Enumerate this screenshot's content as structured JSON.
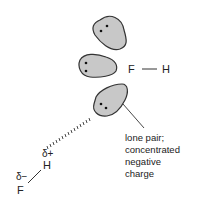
{
  "diagram": {
    "colors": {
      "lobe_fill": "#c8c8c8",
      "lobe_stroke": "#333333",
      "electron_dot": "#111111",
      "line": "#333333",
      "text": "#222222"
    },
    "molecule_top": {
      "atom_left": "F",
      "atom_right": "H",
      "bond": "—"
    },
    "lone_pairs": [
      {
        "id": "lone-pair-top",
        "electrons": 2
      },
      {
        "id": "lone-pair-middle",
        "electrons": 2
      },
      {
        "id": "lone-pair-bottom",
        "electrons": 2
      }
    ],
    "molecule_bottom": {
      "h_atom": "H",
      "f_atom": "F",
      "h_charge": "δ+",
      "f_charge": "δ−"
    },
    "hydrogen_bond": {
      "style": "dashed"
    },
    "annotation": {
      "lines": [
        "lone pair;",
        "concentrated",
        "negative",
        "charge"
      ]
    }
  }
}
